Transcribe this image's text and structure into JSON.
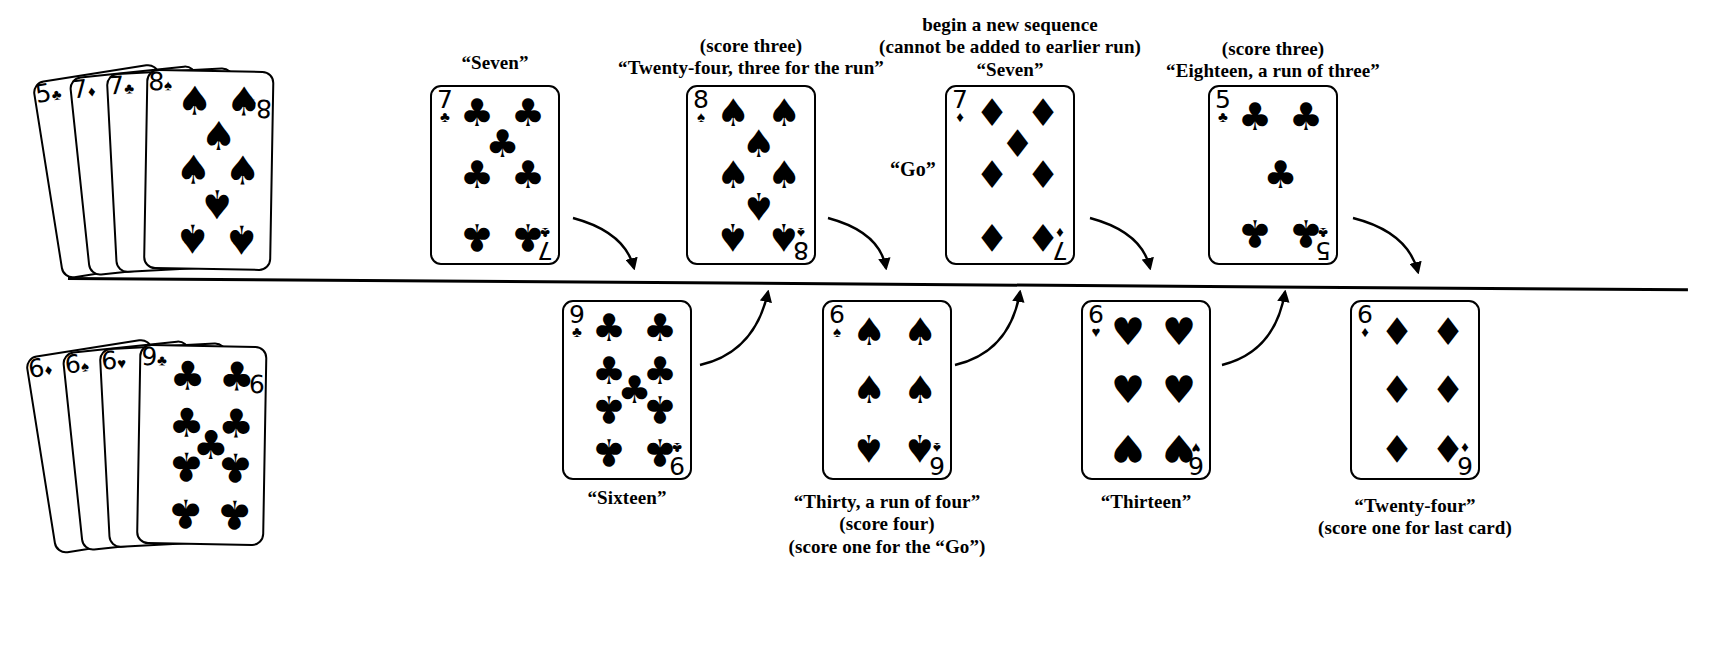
{
  "diagram": {
    "divider": {
      "present": true
    },
    "suits": {
      "spade": "♠",
      "heart": "♥",
      "diamond": "♦",
      "club": "♣"
    }
  },
  "top_hand": {
    "name": "dealer-hand",
    "cards": [
      {
        "rank": "5",
        "suit": "♣",
        "suit_name": "club"
      },
      {
        "rank": "7",
        "suit": "♦",
        "suit_name": "diamond"
      },
      {
        "rank": "7",
        "suit": "♣",
        "suit_name": "club"
      },
      {
        "rank": "8",
        "suit": "♠",
        "suit_name": "spade"
      }
    ]
  },
  "bottom_hand": {
    "name": "pone-hand",
    "cards": [
      {
        "rank": "6",
        "suit": "♦",
        "suit_name": "diamond"
      },
      {
        "rank": "6",
        "suit": "♠",
        "suit_name": "spade"
      },
      {
        "rank": "6",
        "suit": "♥",
        "suit_name": "heart"
      },
      {
        "rank": "9",
        "suit": "♣",
        "suit_name": "club"
      }
    ]
  },
  "top_plays": [
    {
      "rank": "7",
      "suit": "♣",
      "suit_name": "club",
      "filled": true,
      "labels": [
        "“Seven”"
      ]
    },
    {
      "rank": "8",
      "suit": "♠",
      "suit_name": "spade",
      "filled": true,
      "labels": [
        "(score three)",
        "“Twenty-four, three for the run”"
      ]
    },
    {
      "rank": "7",
      "suit": "♦",
      "suit_name": "diamond",
      "filled": false,
      "labels": [
        "begin a new sequence",
        "(cannot be added to earlier run)",
        "“Seven”"
      ]
    },
    {
      "rank": "5",
      "suit": "♣",
      "suit_name": "club",
      "filled": true,
      "labels": [
        "(score three)",
        "“Eighteen, a run of three”"
      ]
    }
  ],
  "bottom_plays": [
    {
      "rank": "9",
      "suit": "♣",
      "suit_name": "club",
      "filled": true,
      "labels": [
        "“Sixteen”"
      ]
    },
    {
      "rank": "6",
      "suit": "♠",
      "suit_name": "spade",
      "filled": true,
      "labels": [
        "“Thirty, a run of four”",
        "(score four)",
        "(score one for the “Go”)"
      ]
    },
    {
      "rank": "6",
      "suit": "♥",
      "suit_name": "heart",
      "filled": false,
      "labels": [
        "“Thirteen”"
      ]
    },
    {
      "rank": "6",
      "suit": "♦",
      "suit_name": "diamond",
      "filled": false,
      "labels": [
        "“Twenty-four”",
        "(score one for last card)"
      ]
    }
  ],
  "annotations": {
    "go_label": "“Go”"
  }
}
